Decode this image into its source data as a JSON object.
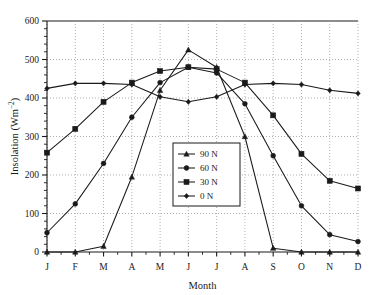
{
  "chart_data": {
    "type": "line",
    "title": "",
    "xlabel": "Month",
    "ylabel": "Insolation (Wm−2)",
    "categories": [
      "J",
      "F",
      "M",
      "A",
      "M",
      "J",
      "J",
      "A",
      "S",
      "O",
      "N",
      "D"
    ],
    "xlim": [
      0,
      11
    ],
    "ylim": [
      0,
      600
    ],
    "yticks": [
      0,
      100,
      200,
      300,
      400,
      500,
      600
    ],
    "ytick_labels": [
      "0",
      "100",
      "200",
      "300",
      "400",
      "500",
      "600"
    ],
    "grid": "dotted-vertical-and-horizontal",
    "legend_position": "center-lower-middle",
    "series": [
      {
        "name": "90 N",
        "marker": "triangle",
        "color": "#1a1a1a",
        "values": [
          0,
          0,
          15,
          195,
          420,
          525,
          480,
          300,
          10,
          0,
          0,
          0
        ]
      },
      {
        "name": "60 N",
        "marker": "circle",
        "color": "#1a1a1a",
        "values": [
          50,
          125,
          230,
          350,
          440,
          480,
          465,
          385,
          250,
          120,
          45,
          27
        ]
      },
      {
        "name": "30 N",
        "marker": "square",
        "color": "#1a1a1a",
        "values": [
          258,
          320,
          390,
          440,
          470,
          480,
          475,
          440,
          355,
          255,
          185,
          165
        ]
      },
      {
        "name": "0 N",
        "marker": "diamond",
        "color": "#1a1a1a",
        "values": [
          425,
          438,
          438,
          435,
          403,
          390,
          403,
          435,
          438,
          435,
          420,
          412
        ]
      }
    ]
  },
  "axes": {
    "y_axis_title": "Insolation (Wm−2)",
    "x_axis_title": "Month"
  },
  "legend": {
    "entries": [
      {
        "label": "90 N"
      },
      {
        "label": "60 N"
      },
      {
        "label": "30 N"
      },
      {
        "label": "0 N"
      }
    ]
  },
  "colors": {
    "line": "#1a1a1a",
    "grid": "#9a9a9a",
    "axis": "#1a1a1a",
    "background": "#ffffff"
  }
}
